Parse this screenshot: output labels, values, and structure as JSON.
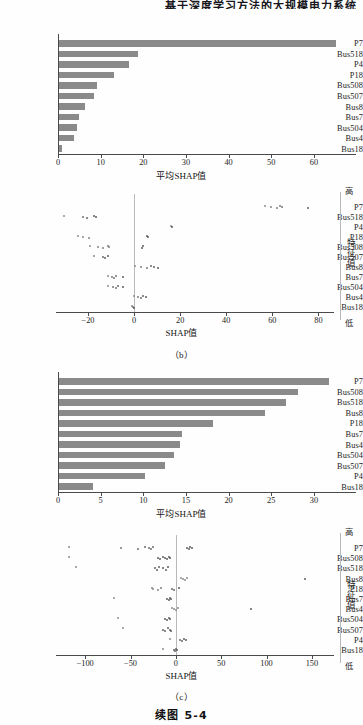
{
  "page": {
    "running_header": "基于深度学习方法的大规模电力系统",
    "figure_caption": "续图 5-4",
    "sub_captions": {
      "b": "（b）",
      "c": "（c）"
    }
  },
  "labels": {
    "mean_shap_axis": "平均SHAP值",
    "shap_axis": "SHAP值",
    "colorbar_title": "特征值",
    "colorbar_high": "高",
    "colorbar_low": "低"
  },
  "colors": {
    "bar_fill": "#8a8a8a",
    "axis": "#4a4a4a",
    "dot_low": "#8d8d8d",
    "dot_high": "#5b5b5b",
    "zero_line": "#b9b9b9",
    "page_bg": "#fefefe"
  },
  "chart_data": [
    {
      "id": "b-bar",
      "type": "bar",
      "orientation": "horizontal",
      "title": "",
      "xlabel": "平均SHAP值",
      "ylabel": "",
      "xlim": [
        0,
        68
      ],
      "xticks": [
        0,
        10,
        20,
        30,
        40,
        50,
        60
      ],
      "grid": false,
      "categories": [
        "P7",
        "Bus518",
        "P4",
        "P18",
        "Bus508",
        "Bus507",
        "Bus8",
        "Bus7",
        "Bus504",
        "Bus4",
        "Bus18"
      ],
      "values": [
        65.0,
        18.6,
        16.4,
        13.0,
        8.8,
        8.2,
        6.1,
        4.6,
        4.2,
        3.5,
        0.8
      ]
    },
    {
      "id": "b-beeswarm",
      "type": "scatter",
      "title": "",
      "xlabel": "SHAP值",
      "ylabel": "",
      "xlim": [
        -33,
        85
      ],
      "xticks": [
        -20,
        0,
        20,
        40,
        60,
        80
      ],
      "xtick_labels": [
        "−20",
        "0",
        "20",
        "40",
        "60",
        "80"
      ],
      "legend": "特征值",
      "legend_high": "高",
      "legend_low": "低",
      "categories": [
        "P7",
        "Bus518",
        "P4",
        "P18",
        "Bus508",
        "Bus507",
        "Bus8",
        "Bus7",
        "Bus504",
        "Bus4",
        "Bus18"
      ],
      "series": [
        {
          "name": "P7",
          "values": [
            57.0,
            59.5,
            62.0,
            63.5,
            64.2,
            75.5
          ]
        },
        {
          "name": "Bus518",
          "values": [
            -30.5,
            -22.0,
            -20.5,
            -17.5,
            -16.5
          ]
        },
        {
          "name": "P4",
          "values": [
            16.0,
            16.6
          ]
        },
        {
          "name": "P18",
          "values": [
            -24.5,
            -22.0,
            -19.5,
            5.5,
            6.0
          ]
        },
        {
          "name": "Bus508",
          "values": [
            -19.0,
            -15.5,
            -13.5,
            -11.5,
            -11.0,
            3.5,
            4.0
          ]
        },
        {
          "name": "Bus507",
          "values": [
            -17.5,
            -13.5,
            -12.5,
            -11.5
          ]
        },
        {
          "name": "Bus8",
          "values": [
            0.5,
            3.0,
            5.5,
            7.5,
            8.5,
            10.5
          ]
        },
        {
          "name": "Bus7",
          "values": [
            -11.5,
            -9.5,
            -8.5,
            -8.0,
            -5.0
          ]
        },
        {
          "name": "Bus504",
          "values": [
            -11.5,
            -9.0,
            -8.0,
            -7.0,
            -5.0
          ]
        },
        {
          "name": "Bus4",
          "values": [
            0.0,
            1.5,
            3.0,
            4.0,
            5.0
          ]
        },
        {
          "name": "Bus18",
          "values": [
            -1.0,
            -0.5,
            0.0
          ]
        }
      ]
    },
    {
      "id": "c-bar",
      "type": "bar",
      "orientation": "horizontal",
      "title": "",
      "xlabel": "平均SHAP值",
      "ylabel": "",
      "xlim": [
        0,
        34
      ],
      "xticks": [
        0,
        5,
        10,
        15,
        20,
        25,
        30
      ],
      "grid": false,
      "categories": [
        "P7",
        "Bus508",
        "Bus518",
        "Bus8",
        "P18",
        "Bus7",
        "Bus4",
        "Bus504",
        "Bus507",
        "P4",
        "Bus18"
      ],
      "values": [
        31.6,
        28.0,
        26.6,
        24.1,
        18.0,
        14.4,
        14.2,
        13.5,
        12.4,
        10.1,
        4.0
      ]
    },
    {
      "id": "c-beeswarm",
      "type": "scatter",
      "title": "",
      "xlabel": "SHAP值",
      "ylabel": "",
      "xlim": [
        -130,
        170
      ],
      "xticks": [
        -100,
        -50,
        0,
        50,
        100,
        150
      ],
      "xtick_labels": [
        "−100",
        "−50",
        "0",
        "50",
        "100",
        "150"
      ],
      "legend": "特征值",
      "legend_high": "高",
      "legend_low": "低",
      "categories": [
        "P7",
        "Bus508",
        "Bus518",
        "Bus8",
        "P18",
        "Bus7",
        "Bus4",
        "Bus504",
        "Bus507",
        "P4",
        "Bus18"
      ],
      "series": [
        {
          "name": "P7",
          "values": [
            -118,
            -60,
            -42,
            -34,
            -30,
            -27,
            -25,
            12,
            14,
            16,
            18
          ]
        },
        {
          "name": "Bus508",
          "values": [
            -118,
            -20,
            -17,
            -14,
            -12,
            -10,
            -8,
            -6
          ]
        },
        {
          "name": "Bus518",
          "values": [
            -110,
            -23,
            -21,
            -19,
            -14,
            -11,
            -9
          ]
        },
        {
          "name": "Bus8",
          "values": [
            6,
            8,
            10,
            12,
            142
          ]
        },
        {
          "name": "P18",
          "values": [
            -26,
            -25,
            -20,
            -16,
            -4,
            -2,
            4
          ]
        },
        {
          "name": "Bus7",
          "values": [
            -68,
            -10,
            -8,
            -6,
            -5
          ]
        },
        {
          "name": "Bus4",
          "values": [
            -4,
            -2,
            0,
            2,
            83
          ]
        },
        {
          "name": "Bus504",
          "values": [
            -64,
            -12,
            -10,
            -8,
            -6
          ]
        },
        {
          "name": "Bus507",
          "values": [
            -58,
            -14,
            -12,
            -9,
            -7,
            -5
          ]
        },
        {
          "name": "P4",
          "values": [
            -6,
            5,
            7,
            9,
            11
          ]
        },
        {
          "name": "Bus18",
          "values": [
            -14,
            -2,
            -1,
            0,
            1
          ]
        }
      ]
    }
  ]
}
